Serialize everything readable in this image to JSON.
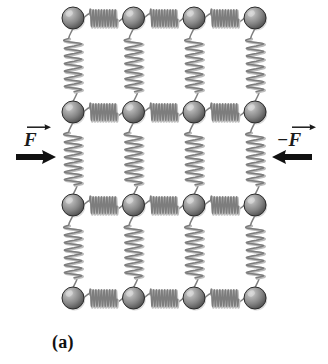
{
  "figure": {
    "caption": "(a)",
    "lattice": {
      "rows": 4,
      "cols": 4,
      "sphere_radius": 11,
      "col_x": [
        73,
        133.5,
        194,
        255
      ],
      "row_y": [
        18,
        112,
        205,
        298
      ],
      "sphere_color_light": "#c9c9c9",
      "sphere_color_mid": "#8f8f8f",
      "sphere_color_dark": "#4a4a4a",
      "sphere_outline": "#2b2b2b",
      "spring_color": "#7d7d7d",
      "spring_shadow": "#bdbdbd",
      "h_spring_coils": 10,
      "v_spring_coils": 7
    },
    "forces": [
      {
        "id": "force-left",
        "label_sign": "",
        "label_symbol": "F",
        "arrow_direction": "right",
        "arrow_color": "#111111",
        "label_x": 24,
        "label_y": 128,
        "arrow_x": 16,
        "arrow_y": 157,
        "arrow_length": 40
      },
      {
        "id": "force-right",
        "label_sign": "−",
        "label_symbol": "F",
        "arrow_direction": "left",
        "arrow_color": "#111111",
        "label_x": 277,
        "label_y": 128,
        "arrow_x": 272,
        "arrow_y": 157,
        "arrow_length": 40
      }
    ],
    "caption_x": 52,
    "caption_y": 332,
    "background": "#ffffff"
  }
}
